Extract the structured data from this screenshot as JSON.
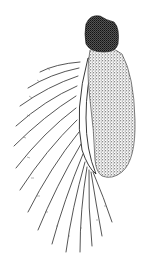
{
  "figure": {
    "background_color": "#ffffff",
    "ink_color": "#1a1a1a",
    "parts": {
      "distal_segment": {
        "shape": "rounded-cap",
        "shading": "dense-stipple"
      },
      "main_segment": {
        "shape": "elongate-oval",
        "shading": "stipple"
      },
      "inner_ridge": {
        "shape": "curved-band",
        "shading": "outline"
      },
      "setae": {
        "count": 15,
        "style": "plumose-lines"
      }
    }
  }
}
